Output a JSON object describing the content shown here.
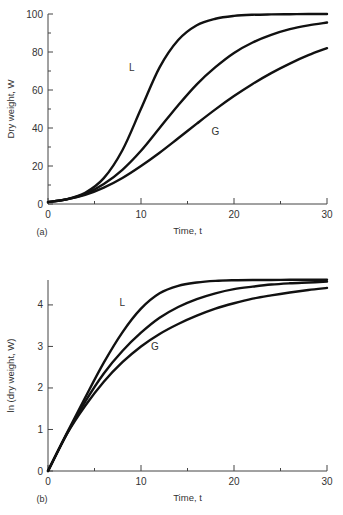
{
  "chart_data": [
    {
      "type": "line",
      "panel_label": "(a)",
      "title": "",
      "xlabel": "Time, t",
      "ylabel": "Dry weight, W",
      "xlim": [
        0,
        30
      ],
      "ylim": [
        0,
        100
      ],
      "xticks": [
        0,
        10,
        20,
        30
      ],
      "xminor": [
        5,
        15,
        25
      ],
      "yticks": [
        0,
        20,
        40,
        60,
        80,
        100
      ],
      "yminor": [
        10,
        30,
        50,
        70,
        90
      ],
      "grid": false,
      "x": [
        0,
        2,
        4,
        6,
        8,
        10,
        12,
        14,
        16,
        18,
        20,
        22,
        24,
        26,
        28,
        30
      ],
      "series": [
        {
          "name": "L",
          "label_at": [
            9,
            72
          ],
          "values": [
            1.0,
            2.5,
            5.9,
            13.6,
            28.3,
            50.1,
            71.9,
            86.3,
            94.1,
            97.5,
            99.0,
            99.6,
            99.8,
            99.9,
            100,
            100
          ]
        },
        {
          "name": "",
          "values": [
            1.0,
            2.4,
            5.3,
            10.5,
            18,
            28,
            40,
            52,
            63,
            72,
            79.5,
            85,
            89,
            92,
            94,
            95.5
          ]
        },
        {
          "name": "G",
          "label_at": [
            18,
            38
          ],
          "values": [
            1.0,
            2.4,
            4.8,
            8.6,
            13.7,
            20.0,
            27.0,
            34.6,
            42.3,
            49.8,
            56.8,
            63.2,
            68.9,
            73.9,
            78.3,
            82.0
          ]
        }
      ]
    },
    {
      "type": "line",
      "panel_label": "(b)",
      "title": "",
      "xlabel": "Time, t",
      "ylabel": "ln (dry weight, W)",
      "xlim": [
        0,
        30
      ],
      "ylim": [
        0,
        4.6
      ],
      "xticks": [
        0,
        10,
        20,
        30
      ],
      "xminor": [
        5,
        15,
        25
      ],
      "yticks": [
        0,
        1,
        2,
        3,
        4
      ],
      "yminor": [],
      "grid": false,
      "x": [
        0,
        2,
        4,
        6,
        8,
        10,
        12,
        14,
        16,
        18,
        20,
        22,
        24,
        26,
        28,
        30
      ],
      "series": [
        {
          "name": "L",
          "label_at": [
            8,
            4.05
          ],
          "values": [
            0,
            0.9,
            1.77,
            2.61,
            3.34,
            3.91,
            4.28,
            4.46,
            4.54,
            4.58,
            4.595,
            4.6,
            4.6,
            4.605,
            4.605,
            4.605
          ]
        },
        {
          "name": "",
          "values": [
            0,
            0.88,
            1.67,
            2.35,
            2.89,
            3.33,
            3.69,
            3.95,
            4.14,
            4.28,
            4.38,
            4.44,
            4.49,
            4.52,
            4.54,
            4.56
          ]
        },
        {
          "name": "G",
          "label_at": [
            11.5,
            3.0
          ],
          "values": [
            0,
            0.88,
            1.57,
            2.15,
            2.62,
            3.0,
            3.3,
            3.54,
            3.74,
            3.91,
            4.04,
            4.15,
            4.23,
            4.3,
            4.36,
            4.41
          ]
        }
      ]
    }
  ]
}
